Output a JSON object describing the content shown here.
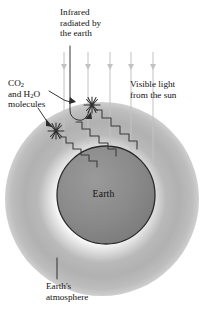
{
  "figure": {
    "background_color": "#ffffff"
  },
  "labels": {
    "infrared": {
      "line1": "Infrared",
      "line2": "radiated by",
      "line3": "the earth"
    },
    "co2": {
      "line1_pre": "CO",
      "line1_sub": "2",
      "line2_pre": "and H",
      "line2_sub": "2",
      "line2_post": "O",
      "line3": "molecules"
    },
    "visible": {
      "line1": "Visible light",
      "line2": "from the sun"
    },
    "atmosphere": {
      "line1": "Earth's",
      "line2": "atmosphere"
    },
    "earth": "Earth"
  },
  "colors": {
    "text": "#111111",
    "earth_fill": "#878787",
    "earth_edge": "#2b2b2b",
    "atmosphere_outer": "#c9c9c9",
    "atmosphere_mid": "#b3b3b3",
    "atmosphere_glow": "#ffffff",
    "ray_stroke": "#c2c2c2",
    "wave_stroke": "#3a3a3a",
    "leader_stroke": "#2b2b2b",
    "molecule_stroke": "#2f2f2f"
  },
  "geometry": {
    "canvas_width": 207,
    "canvas_height": 321,
    "atmosphere_center_x": 102,
    "atmosphere_center_y": 199,
    "atmosphere_radius": 97,
    "earth_center_x": 106,
    "earth_center_y": 195,
    "earth_radius": 49
  },
  "sun_rays": [
    {
      "name": "ray-1",
      "x": 64,
      "y_top": 52,
      "y_bottom": 152
    },
    {
      "name": "ray-2",
      "x": 88,
      "y_top": 52,
      "y_bottom": 144
    },
    {
      "name": "ray-3",
      "x": 110,
      "y_top": 52,
      "y_bottom": 146
    },
    {
      "name": "ray-4",
      "x": 131,
      "y_top": 52,
      "y_bottom": 150
    },
    {
      "name": "ray-5",
      "x": 153,
      "y_top": 52,
      "y_bottom": 163
    }
  ],
  "infrared_waves": [
    {
      "name": "wave-lower",
      "path": "M 60 137 L 66 137 L 66 143 L 73 143 L 73 149 L 81 149 L 81 155 L 89 155 L 89 161 L 97 161 L 97 166"
    },
    {
      "name": "wave-middle",
      "path": "M 76 122 L 82 122 L 82 129 L 90 129 L 90 136 L 99 136 L 99 143 L 108 143 L 108 149 L 116 149 L 116 155"
    },
    {
      "name": "wave-upper",
      "path": "M 95 110 L 102 110 L 102 118 L 111 118 L 111 126 L 120 126 L 120 134 L 129 134 L 129 141 L 137 141 L 137 148"
    }
  ],
  "molecules": [
    {
      "name": "molecule-lower",
      "x": 56,
      "y": 131,
      "radius": 7
    },
    {
      "name": "molecule-upper",
      "x": 92,
      "y": 105,
      "radius": 7
    }
  ],
  "leaders": [
    {
      "name": "leader-infrared",
      "path": "M 70 46 L 70 112 L 72 118 L 80 122 L 88 112"
    },
    {
      "name": "leader-co2-upper",
      "path": "M 48 92 L 66 102 L 74 101 L 72 106"
    },
    {
      "name": "leader-co2-lower",
      "path": "M 40 110 L 48 122 L 52 126"
    },
    {
      "name": "leader-atmosphere",
      "path": "M 57 258 L 57 279"
    }
  ]
}
